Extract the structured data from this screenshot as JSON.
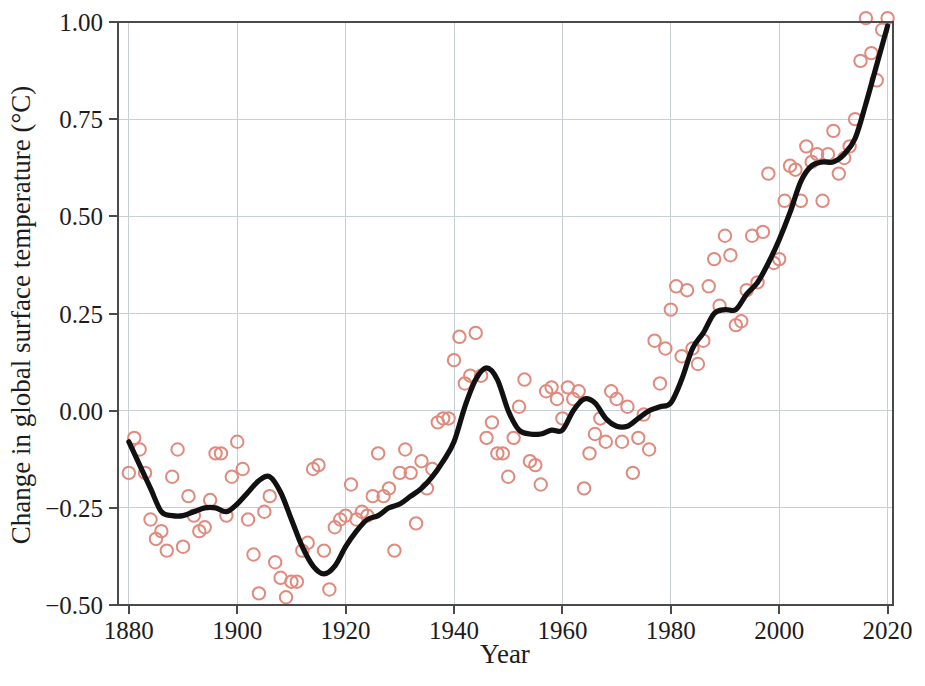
{
  "chart_data": {
    "type": "line",
    "title": "",
    "subtitle": "",
    "xlabel": "Year",
    "ylabel": "Change in global surface temperature (°C)",
    "xlim": [
      1878,
      2021
    ],
    "ylim": [
      -0.5,
      1.0
    ],
    "grid": true,
    "legend": false,
    "legend_position": "none",
    "xticks": [
      1880,
      1900,
      1920,
      1940,
      1960,
      1980,
      2000,
      2020
    ],
    "xtick_labels": [
      "1880",
      "1900",
      "1920",
      "1940",
      "1960",
      "1980",
      "2000",
      "2020"
    ],
    "yticks": [
      -0.5,
      -0.25,
      0.0,
      0.25,
      0.5,
      0.75,
      1.0
    ],
    "ytick_labels": [
      "−0.50",
      "−0.25",
      "0.00",
      "0.25",
      "0.50",
      "0.75",
      "1.00"
    ],
    "colors": {
      "marker_stroke": "#e08a7d",
      "line": "#111111",
      "grid": "#c8cfd2",
      "frame": "#4a4a4a",
      "background": "#ffffff"
    },
    "series": [
      {
        "name": "Annual mean",
        "type": "scatter",
        "marker": "open-circle",
        "x": [
          1880,
          1881,
          1882,
          1883,
          1884,
          1885,
          1886,
          1887,
          1888,
          1889,
          1890,
          1891,
          1892,
          1893,
          1894,
          1895,
          1896,
          1897,
          1898,
          1899,
          1900,
          1901,
          1902,
          1903,
          1904,
          1905,
          1906,
          1907,
          1908,
          1909,
          1910,
          1911,
          1912,
          1913,
          1914,
          1915,
          1916,
          1917,
          1918,
          1919,
          1920,
          1921,
          1922,
          1923,
          1924,
          1925,
          1926,
          1927,
          1928,
          1929,
          1930,
          1931,
          1932,
          1933,
          1934,
          1935,
          1936,
          1937,
          1938,
          1939,
          1940,
          1941,
          1942,
          1943,
          1944,
          1945,
          1946,
          1947,
          1948,
          1949,
          1950,
          1951,
          1952,
          1953,
          1954,
          1955,
          1956,
          1957,
          1958,
          1959,
          1960,
          1961,
          1962,
          1963,
          1964,
          1965,
          1966,
          1967,
          1968,
          1969,
          1970,
          1971,
          1972,
          1973,
          1974,
          1975,
          1976,
          1977,
          1978,
          1979,
          1980,
          1981,
          1982,
          1983,
          1984,
          1985,
          1986,
          1987,
          1988,
          1989,
          1990,
          1991,
          1992,
          1993,
          1994,
          1995,
          1996,
          1997,
          1998,
          1999,
          2000,
          2001,
          2002,
          2003,
          2004,
          2005,
          2006,
          2007,
          2008,
          2009,
          2010,
          2011,
          2012,
          2013,
          2014,
          2015,
          2016,
          2017,
          2018,
          2019,
          2020
        ],
        "y": [
          -0.16,
          -0.07,
          -0.1,
          -0.16,
          -0.28,
          -0.33,
          -0.31,
          -0.36,
          -0.17,
          -0.1,
          -0.35,
          -0.22,
          -0.27,
          -0.31,
          -0.3,
          -0.23,
          -0.11,
          -0.11,
          -0.27,
          -0.17,
          -0.08,
          -0.15,
          -0.28,
          -0.37,
          -0.47,
          -0.26,
          -0.22,
          -0.39,
          -0.43,
          -0.48,
          -0.44,
          -0.44,
          -0.36,
          -0.34,
          -0.15,
          -0.14,
          -0.36,
          -0.46,
          -0.3,
          -0.28,
          -0.27,
          -0.19,
          -0.28,
          -0.26,
          -0.27,
          -0.22,
          -0.11,
          -0.22,
          -0.2,
          -0.36,
          -0.16,
          -0.1,
          -0.16,
          -0.29,
          -0.13,
          -0.2,
          -0.15,
          -0.03,
          -0.02,
          -0.02,
          0.13,
          0.19,
          0.07,
          0.09,
          0.2,
          0.09,
          -0.07,
          -0.03,
          -0.11,
          -0.11,
          -0.17,
          -0.07,
          0.01,
          0.08,
          -0.13,
          -0.14,
          -0.19,
          0.05,
          0.06,
          0.03,
          -0.02,
          0.06,
          0.03,
          0.05,
          -0.2,
          -0.11,
          -0.06,
          -0.02,
          -0.08,
          0.05,
          0.03,
          -0.08,
          0.01,
          -0.16,
          -0.07,
          -0.01,
          -0.1,
          0.18,
          0.07,
          0.16,
          0.26,
          0.32,
          0.14,
          0.31,
          0.16,
          0.12,
          0.18,
          0.32,
          0.39,
          0.27,
          0.45,
          0.4,
          0.22,
          0.23,
          0.31,
          0.45,
          0.33,
          0.46,
          0.61,
          0.38,
          0.39,
          0.54,
          0.63,
          0.62,
          0.54,
          0.68,
          0.64,
          0.66,
          0.54,
          0.66,
          0.72,
          0.61,
          0.65,
          0.68,
          0.75,
          0.9,
          1.01,
          0.92,
          0.85,
          0.98,
          1.01
        ]
      },
      {
        "name": "Lowess smoothing",
        "type": "line",
        "x": [
          1880,
          1882,
          1884,
          1886,
          1888,
          1890,
          1892,
          1894,
          1896,
          1898,
          1900,
          1902,
          1904,
          1906,
          1908,
          1910,
          1912,
          1914,
          1916,
          1918,
          1920,
          1922,
          1924,
          1926,
          1928,
          1930,
          1932,
          1934,
          1936,
          1938,
          1940,
          1942,
          1944,
          1946,
          1948,
          1950,
          1952,
          1954,
          1956,
          1958,
          1960,
          1962,
          1964,
          1966,
          1968,
          1970,
          1972,
          1974,
          1976,
          1978,
          1980,
          1982,
          1984,
          1986,
          1988,
          1990,
          1992,
          1994,
          1996,
          1998,
          2000,
          2002,
          2004,
          2006,
          2008,
          2010,
          2012,
          2014,
          2016,
          2018,
          2020
        ],
        "y": [
          -0.08,
          -0.14,
          -0.2,
          -0.26,
          -0.27,
          -0.27,
          -0.26,
          -0.25,
          -0.25,
          -0.26,
          -0.24,
          -0.21,
          -0.18,
          -0.17,
          -0.21,
          -0.28,
          -0.35,
          -0.4,
          -0.42,
          -0.4,
          -0.35,
          -0.31,
          -0.28,
          -0.27,
          -0.25,
          -0.24,
          -0.22,
          -0.2,
          -0.17,
          -0.13,
          -0.08,
          0.01,
          0.08,
          0.11,
          0.08,
          0.0,
          -0.05,
          -0.06,
          -0.06,
          -0.05,
          -0.05,
          0.0,
          0.03,
          0.02,
          -0.02,
          -0.04,
          -0.04,
          -0.02,
          0.0,
          0.01,
          0.02,
          0.08,
          0.16,
          0.2,
          0.25,
          0.26,
          0.26,
          0.3,
          0.33,
          0.38,
          0.44,
          0.51,
          0.59,
          0.63,
          0.64,
          0.64,
          0.66,
          0.7,
          0.79,
          0.89,
          0.99
        ]
      }
    ],
    "annotations": []
  }
}
